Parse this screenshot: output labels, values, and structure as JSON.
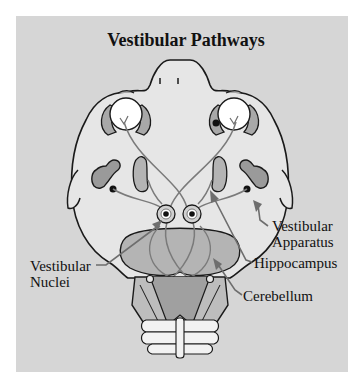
{
  "title": "Vestibular Pathways",
  "labels": {
    "vestibular_apparatus": [
      "Vestibular",
      "Apparatus"
    ],
    "hippocampus": "Hippocampus",
    "cerebellum": "Cerebellum",
    "vestibular_nuclei": [
      "Vestibular",
      "Nuclei"
    ]
  },
  "colors": {
    "background": "#d6d6d6",
    "head_fill": "#e6e6e6",
    "organ_fill": "#b4b4b4",
    "outline": "#1a1a1a",
    "pathway": "#7a7a7a",
    "pointer": "#6e6e6e"
  }
}
